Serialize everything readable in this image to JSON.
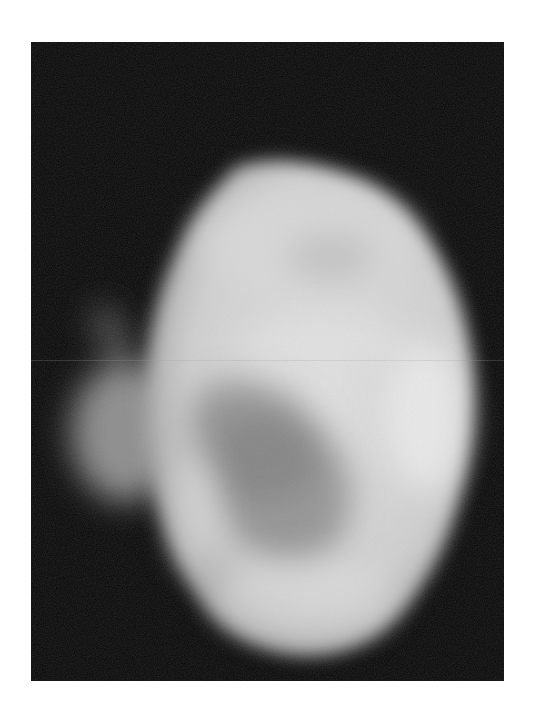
{
  "image": {
    "description": "Grayscale radiograph of a rounded, egg-shaped organ-like specimen on a black background with a faint protrusion on the left",
    "background_color": "#ffffff",
    "frame_color": "#070707",
    "specimen_color": "#d9d9d9",
    "shadow_region_color": "#8a8a8a"
  }
}
